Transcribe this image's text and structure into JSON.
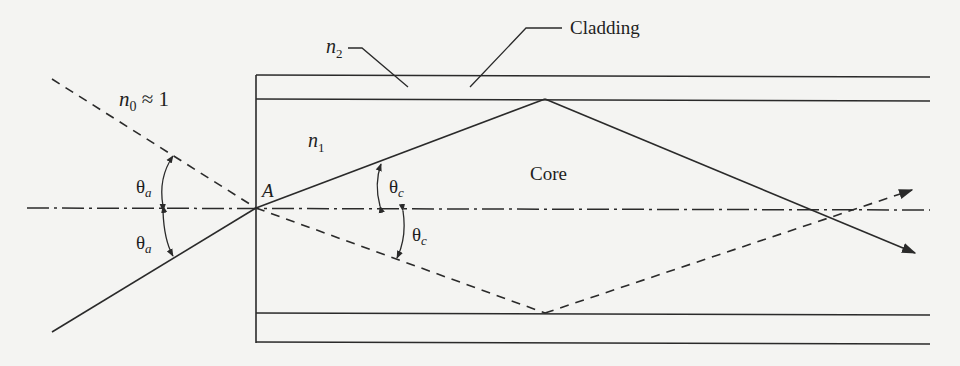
{
  "diagram": {
    "type": "optical-fiber-acceptance-angle",
    "labels": {
      "n0": "n",
      "n0_sub": "0",
      "n0_rest": " ≈ 1",
      "n1": "n",
      "n1_sub": "1",
      "n2": "n",
      "n2_sub": "2",
      "cladding": "Cladding",
      "core": "Core",
      "point_a": "A",
      "theta_a_upper": "θ",
      "theta_a_upper_sub": "a",
      "theta_a_lower": "θ",
      "theta_a_lower_sub": "a",
      "theta_c_upper": "θ",
      "theta_c_upper_sub": "c",
      "theta_c_lower": "θ",
      "theta_c_lower_sub": "c"
    },
    "colors": {
      "line": "#2a2a2a",
      "background": "#f4f4f2"
    }
  }
}
